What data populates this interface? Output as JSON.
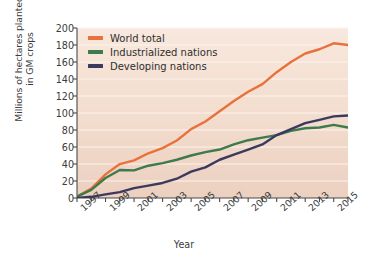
{
  "chart_data": {
    "type": "line",
    "title": "",
    "xlabel": "Year",
    "ylabel": "Millions of hectares planted in GM crops",
    "ylabel_line1": "Millions of hectares planted",
    "ylabel_line2": "in GM crops",
    "xlim": [
      1996,
      2015
    ],
    "ylim": [
      0,
      200
    ],
    "yticks": [
      0,
      20,
      40,
      60,
      80,
      100,
      120,
      140,
      160,
      180,
      200
    ],
    "xticks": [
      1996,
      1997,
      1998,
      1999,
      2000,
      2001,
      2002,
      2003,
      2004,
      2005,
      2006,
      2007,
      2008,
      2009,
      2010,
      2011,
      2012,
      2013,
      2014,
      2015
    ],
    "xtick_labels": [
      "1997",
      "1999",
      "2001",
      "2003",
      "2005",
      "2007",
      "2009",
      "2011",
      "2013",
      "2015"
    ],
    "xtick_label_years": [
      1997,
      1999,
      2001,
      2003,
      2005,
      2007,
      2009,
      2011,
      2013,
      2015
    ],
    "grid": "horizontal",
    "legend_position": "top-left",
    "x": [
      1996,
      1997,
      1998,
      1999,
      2000,
      2001,
      2002,
      2003,
      2004,
      2005,
      2006,
      2007,
      2008,
      2009,
      2010,
      2011,
      2012,
      2013,
      2014,
      2015
    ],
    "series": [
      {
        "name": "World total",
        "color": "#e8713c",
        "values": [
          1.7,
          11,
          27.8,
          39.9,
          44.2,
          52.6,
          58.7,
          67.7,
          81,
          90,
          102,
          114,
          125,
          134,
          148,
          160,
          170,
          175,
          182,
          180
        ]
      },
      {
        "name": "Industrialized nations",
        "color": "#3f7a4c",
        "values": [
          1.7,
          9.6,
          23.5,
          33,
          32.5,
          38,
          41,
          45,
          50,
          54,
          57,
          63,
          68,
          71,
          74,
          79,
          82,
          83,
          86,
          83
        ]
      },
      {
        "name": "Developing nations",
        "color": "#3b3a5e",
        "values": [
          0.2,
          1.4,
          4.3,
          6.9,
          11.7,
          14.6,
          17.7,
          22.7,
          31,
          36,
          45,
          51,
          57,
          63,
          74,
          81,
          88,
          92,
          96,
          97
        ]
      }
    ]
  },
  "axes": {
    "xlabel": "Year",
    "ylabel_line1": "Millions of hectares planted",
    "ylabel_line2": "in GM crops"
  },
  "legend": {
    "items": [
      {
        "label": "World total",
        "color": "#e8713c"
      },
      {
        "label": "Industrialized nations",
        "color": "#3f7a4c"
      },
      {
        "label": "Developing nations",
        "color": "#3b3a5e"
      }
    ]
  },
  "style": {
    "plot_background_top": "#f7e6da",
    "plot_background_bottom": "#eed3c4",
    "page_background": "#ffffff",
    "gridline_color": "#fdf3ec",
    "axis_color": "#4a4a4a",
    "text_color": "#3b3b3b"
  }
}
